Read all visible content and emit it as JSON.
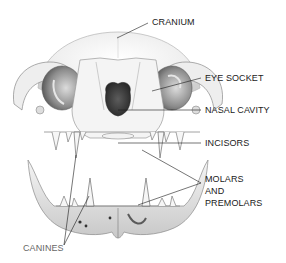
{
  "diagram": {
    "labels": [
      {
        "id": "cranium",
        "text": "CRANIUM",
        "x": 152,
        "y": 17
      },
      {
        "id": "eye-socket",
        "text": "EYE SOCKET",
        "x": 205,
        "y": 75
      },
      {
        "id": "nasal-cavity",
        "text": "NASAL CAVITY",
        "x": 205,
        "y": 106
      },
      {
        "id": "incisors",
        "text": "INCISORS",
        "x": 205,
        "y": 139
      },
      {
        "id": "molars-line1",
        "text": "MOLARS",
        "x": 205,
        "y": 175
      },
      {
        "id": "molars-line2",
        "text": "AND",
        "x": 205,
        "y": 187
      },
      {
        "id": "molars-line3",
        "text": "PREMOLARS",
        "x": 205,
        "y": 199
      },
      {
        "id": "canines",
        "text": "CANINES",
        "x": 23,
        "y": 245
      }
    ],
    "colors": {
      "background": "#ffffff",
      "ink": "#1a1a1a",
      "bone": "#f2f2f2",
      "shade": "#9a9a9a",
      "dark": "#3a3a3a"
    }
  }
}
